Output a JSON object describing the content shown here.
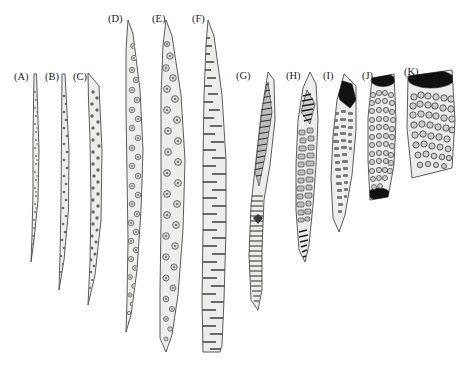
{
  "figure": {
    "background_color": "#ffffff",
    "outline_color": "#4a4a4a",
    "fill_color": "#ededeb",
    "inclusion_color": "#707070",
    "dark_cap_color": "#111111",
    "width": 464,
    "height": 366
  },
  "labels": [
    {
      "id": "A",
      "text": "(A)",
      "x": 14,
      "y": 80,
      "baseline_y": 80
    },
    {
      "id": "B",
      "text": "(B)",
      "x": 45,
      "y": 80,
      "baseline_y": 80
    },
    {
      "id": "C",
      "text": "(C)",
      "x": 73,
      "y": 80,
      "baseline_y": 80
    },
    {
      "id": "D",
      "text": "(D)",
      "x": 108,
      "y": 22,
      "baseline_y": 22
    },
    {
      "id": "E",
      "text": "(E)",
      "x": 152,
      "y": 22,
      "baseline_y": 22
    },
    {
      "id": "F",
      "text": "(F)",
      "x": 192,
      "y": 22,
      "baseline_y": 22
    },
    {
      "id": "G",
      "text": "(G)",
      "x": 236,
      "y": 79,
      "baseline_y": 79
    },
    {
      "id": "H",
      "text": "(H)",
      "x": 286,
      "y": 79,
      "baseline_y": 79
    },
    {
      "id": "I",
      "text": "(I)",
      "x": 323,
      "y": 79,
      "baseline_y": 79
    },
    {
      "id": "J",
      "text": "(J)",
      "x": 362,
      "y": 79,
      "baseline_y": 79
    },
    {
      "id": "K",
      "text": "(K)",
      "x": 404,
      "y": 75,
      "baseline_y": 75
    }
  ],
  "specimens": [
    {
      "id": "A",
      "label": "(A)",
      "inclusion_type": "fine-dots",
      "inclusion_size": 1.0,
      "inclusion_count": 46,
      "has_dark_cap": false,
      "top_y": 72,
      "bottom_y": 262,
      "max_width": 5,
      "shape": "very-narrow-sigmoid-filament"
    },
    {
      "id": "B",
      "label": "(B)",
      "inclusion_type": "small-dots",
      "inclusion_size": 1.5,
      "inclusion_count": 52,
      "has_dark_cap": false,
      "top_y": 72,
      "bottom_y": 290,
      "max_width": 7,
      "shape": "narrow-sigmoid-filament"
    },
    {
      "id": "C",
      "label": "(C)",
      "inclusion_type": "small-dots",
      "inclusion_size": 2.0,
      "inclusion_count": 70,
      "has_dark_cap": false,
      "top_y": 72,
      "bottom_y": 305,
      "max_width": 10,
      "shape": "narrow-tapering-filament"
    },
    {
      "id": "D",
      "label": "(D)",
      "inclusion_type": "ringed-discs",
      "inclusion_size": 3.4,
      "inclusion_count": 56,
      "has_dark_cap": false,
      "top_y": 18,
      "bottom_y": 332,
      "max_width": 16,
      "shape": "long-tapering-blade"
    },
    {
      "id": "E",
      "label": "(E)",
      "inclusion_type": "ringed-discs",
      "inclusion_size": 4.2,
      "inclusion_count": 52,
      "has_dark_cap": false,
      "top_y": 18,
      "bottom_y": 352,
      "max_width": 20,
      "shape": "long-blade-rounded-base"
    },
    {
      "id": "F",
      "label": "(F)",
      "inclusion_type": "transverse-bars",
      "inclusion_size": 0,
      "inclusion_count": 78,
      "has_dark_cap": false,
      "top_y": 18,
      "bottom_y": 352,
      "max_width": 24,
      "shape": "long-banded-blade"
    },
    {
      "id": "G",
      "label": "(G)",
      "inclusion_type": "fine-striae",
      "inclusion_size": 0,
      "inclusion_count": 120,
      "has_dark_cap": false,
      "top_y": 70,
      "bottom_y": 312,
      "max_width": 26,
      "shape": "lanceolate-striate"
    },
    {
      "id": "H",
      "label": "(H)",
      "inclusion_type": "rectangular-plates-and-striae",
      "inclusion_size": 5.0,
      "inclusion_count": 58,
      "has_dark_cap": false,
      "top_y": 70,
      "bottom_y": 262,
      "max_width": 26,
      "shape": "spindle-with-plates"
    },
    {
      "id": "I",
      "label": "(I)",
      "inclusion_type": "short-dashes",
      "inclusion_size": 3.0,
      "inclusion_count": 92,
      "has_dark_cap": true,
      "top_y": 72,
      "bottom_y": 232,
      "max_width": 27,
      "shape": "oblique-cylinder-dark-apex"
    },
    {
      "id": "J",
      "label": "(J)",
      "inclusion_type": "ring-clusters",
      "inclusion_size": 4.0,
      "inclusion_count": 96,
      "has_dark_cap": true,
      "top_y": 72,
      "bottom_y": 200,
      "max_width": 30,
      "shape": "short-cylinder-two-dark-caps"
    },
    {
      "id": "K",
      "label": "(K)",
      "inclusion_type": "dense-ring-clusters",
      "inclusion_size": 5.0,
      "inclusion_count": 110,
      "has_dark_cap": true,
      "top_y": 68,
      "bottom_y": 178,
      "max_width": 48,
      "shape": "broad-short-cylinder"
    }
  ]
}
